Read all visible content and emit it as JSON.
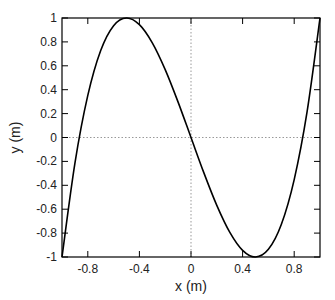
{
  "chart_data": {
    "type": "line",
    "title": "",
    "xlabel": "x (m)",
    "ylabel": "y (m)",
    "xlim": [
      -1,
      1
    ],
    "ylim": [
      -1,
      1
    ],
    "xticks": [
      -0.8,
      -0.4,
      0,
      0.4,
      0.8
    ],
    "xtick_labels": [
      "-0.8",
      "-0.4",
      "0",
      "0.4",
      "0.8"
    ],
    "yticks": [
      -1,
      -0.8,
      -0.6,
      -0.4,
      -0.2,
      0,
      0.2,
      0.4,
      0.6,
      0.8,
      1
    ],
    "ytick_labels": [
      "-1",
      "-0.8",
      "-0.6",
      "-0.4",
      "-0.2",
      "0",
      "0.2",
      "0.4",
      "0.6",
      "0.8",
      "1"
    ],
    "grid": false,
    "reference_lines": {
      "x": 0,
      "y": 0,
      "style": "dotted",
      "color": "#999999"
    },
    "legend": null,
    "series": [
      {
        "name": "y",
        "color": "#000000",
        "x": [
          -1.0,
          -0.9,
          -0.8,
          -0.7,
          -0.6,
          -0.5,
          -0.4,
          -0.3,
          -0.2,
          -0.1,
          0.0,
          0.1,
          0.2,
          0.3,
          0.4,
          0.5,
          0.6,
          0.7,
          0.8,
          0.9,
          1.0
        ],
        "y": [
          -1.0,
          -0.216,
          0.352,
          0.728,
          0.936,
          1.0,
          0.944,
          0.792,
          0.568,
          0.296,
          0.0,
          -0.296,
          -0.568,
          -0.792,
          -0.944,
          -1.0,
          -0.936,
          -0.728,
          -0.352,
          0.216,
          1.0
        ]
      }
    ]
  }
}
